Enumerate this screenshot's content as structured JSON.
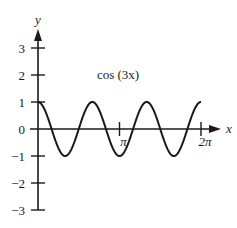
{
  "chart_data": {
    "type": "line",
    "title": "cos (3x)",
    "xlabel": "x",
    "ylabel": "y",
    "function": "y = cos(3x)",
    "x_range": [
      0,
      6.2832
    ],
    "ylim": [
      -3,
      3
    ],
    "x_ticks": [
      {
        "value": 3.1416,
        "label": "π"
      },
      {
        "value": 6.2832,
        "label": "2π"
      }
    ],
    "y_ticks": [
      {
        "value": 3,
        "label": "3"
      },
      {
        "value": 2,
        "label": "2"
      },
      {
        "value": 1,
        "label": "1"
      },
      {
        "value": 0,
        "label": "0"
      },
      {
        "value": -1,
        "label": "−1"
      },
      {
        "value": -2,
        "label": "−2"
      },
      {
        "value": -3,
        "label": "−3"
      }
    ],
    "series": [
      {
        "name": "cos (3x)",
        "x": [
          0,
          0.5236,
          1.0472,
          1.5708,
          2.0944,
          2.618,
          3.1416,
          3.6652,
          4.1888,
          4.7124,
          5.236,
          5.7596,
          6.2832
        ],
        "values": [
          1,
          0,
          -1,
          0,
          1,
          0,
          -1,
          0,
          1,
          0,
          -1,
          0,
          1
        ]
      }
    ],
    "grid": false,
    "legend": "none",
    "colors": {
      "curve": "#1a1a1a",
      "axes": "#1a1a1a",
      "background": "#ffffff"
    }
  }
}
